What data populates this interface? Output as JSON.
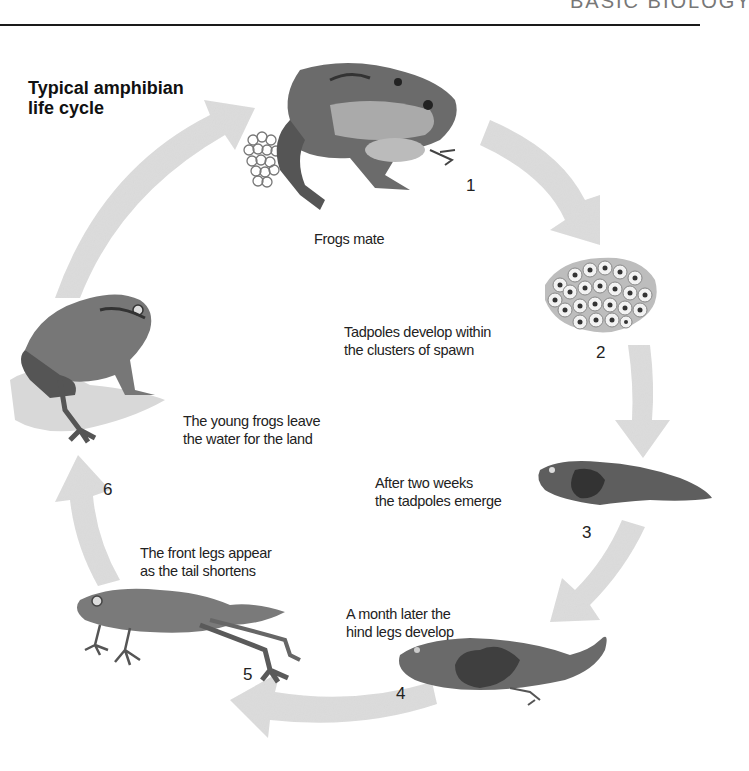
{
  "header": {
    "running_title": "BASIC BIOLOGY"
  },
  "title": {
    "line1": "Typical amphibian",
    "line2": "life cycle"
  },
  "colors": {
    "arrow": "#dcdcdc",
    "text": "#1e1e1e",
    "rule": "#1a1a1a",
    "illustration": "#6e6e6e"
  },
  "stages": [
    {
      "number": "1",
      "caption": [
        "Frogs mate"
      ],
      "illustration": "mating-frogs-with-spawn"
    },
    {
      "number": "2",
      "caption": [
        "Tadpoles develop within",
        "the clusters of spawn"
      ],
      "illustration": "frogspawn-cluster"
    },
    {
      "number": "3",
      "caption": [
        "After two weeks",
        "the tadpoles emerge"
      ],
      "illustration": "tadpole"
    },
    {
      "number": "4",
      "caption": [
        "A month later the",
        "hind legs develop"
      ],
      "illustration": "tadpole-with-hind-legs"
    },
    {
      "number": "5",
      "caption": [
        "The front legs appear",
        "as the tail shortens"
      ],
      "illustration": "froglet-with-tail"
    },
    {
      "number": "6",
      "caption": [
        "The young frogs leave",
        "the water for the land"
      ],
      "illustration": "young-frog-on-land"
    }
  ]
}
